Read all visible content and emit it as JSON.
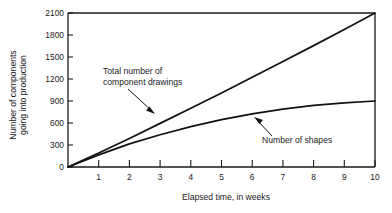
{
  "chart_data": {
    "type": "line",
    "title": "",
    "subtitle": "",
    "xlabel": "Elapsed time, in weeks",
    "ylabel": "Number of components going into production",
    "ylabel_line1": "Number of components",
    "ylabel_line2": "going into production",
    "xlim": [
      0,
      10
    ],
    "ylim": [
      0,
      2100
    ],
    "grid": false,
    "legend_position": "none",
    "background_color": "#ffffff",
    "line_color": "#111111",
    "x_ticks": [
      1,
      2,
      3,
      4,
      5,
      6,
      7,
      8,
      9,
      10
    ],
    "x_tick_labels": [
      "1",
      "2",
      "3",
      "4",
      "5",
      "6",
      "7",
      "8",
      "9",
      "10"
    ],
    "y_ticks": [
      0,
      300,
      600,
      900,
      1200,
      1500,
      1800,
      2100
    ],
    "y_tick_labels": [
      "0",
      "300",
      "600",
      "900",
      "1200",
      "1500",
      "1800",
      "2100"
    ],
    "x": [
      0,
      1,
      2,
      3,
      4,
      5,
      6,
      7,
      8,
      9,
      10
    ],
    "series": [
      {
        "name": "Total number of component drawings",
        "values": [
          0,
          190,
          390,
          595,
          800,
          1010,
          1225,
          1440,
          1655,
          1875,
          2100
        ]
      },
      {
        "name": "Number of shapes",
        "values": [
          0,
          165,
          315,
          440,
          550,
          645,
          725,
          790,
          840,
          875,
          900
        ]
      }
    ],
    "annotations": [
      {
        "text_line1": "Total number of",
        "text_line2": "component drawings",
        "label": "Total number of component drawings",
        "points_to_series": "Total number of component drawings"
      },
      {
        "text_line1": "Number of shapes",
        "text_line2": "",
        "label": "Number of shapes",
        "points_to_series": "Number of shapes"
      }
    ]
  }
}
